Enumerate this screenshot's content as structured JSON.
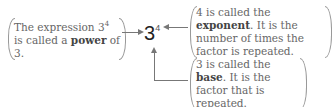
{
  "expression": {
    "base": "3",
    "exponent": "4"
  },
  "notes": {
    "power": {
      "pre": "The expression 3",
      "sup": "4",
      "mid": " is called a ",
      "bold": "power",
      "post": " of 3."
    },
    "exponent": {
      "pre": "4 is called the ",
      "bold": "exponent",
      "post": ". It is the number of times the factor is repeated."
    },
    "base": {
      "pre": "3 is called the ",
      "bold": "base",
      "post": ". It is the factor that is repeated."
    }
  }
}
